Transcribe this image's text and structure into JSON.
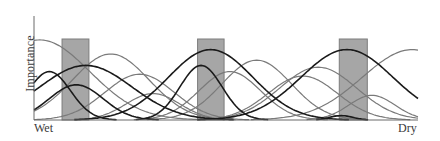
{
  "chart_data": {
    "type": "line",
    "title": "",
    "xlabel": "",
    "ylabel": "Importance",
    "x_axis_ends": {
      "left": "Wet",
      "right": "Dry"
    },
    "grid": false,
    "legend": null,
    "x_range": [
      0,
      100
    ],
    "y_range": [
      0,
      1
    ],
    "shaded_bands": [
      {
        "x0": 7.3,
        "x1": 14.3,
        "color": "#a6a6a6"
      },
      {
        "x0": 42.6,
        "x1": 49.5,
        "color": "#a6a6a6"
      },
      {
        "x0": 79.5,
        "x1": 86.8,
        "color": "#a6a6a6"
      }
    ],
    "series": [
      {
        "name": "curve-1",
        "emphasis": "gray",
        "peak_x": 1.5,
        "peak_y": 0.91,
        "width": 13
      },
      {
        "name": "curve-2",
        "emphasis": "black",
        "peak_x": 13.5,
        "peak_y": 0.62,
        "width": 12
      },
      {
        "name": "curve-3",
        "emphasis": "black",
        "peak_x": 11,
        "peak_y": 0.4,
        "width": 7
      },
      {
        "name": "curve-4",
        "emphasis": "black",
        "peak_x": 4,
        "peak_y": 0.55,
        "width": 5.5
      },
      {
        "name": "curve-5",
        "emphasis": "gray",
        "peak_x": 20,
        "peak_y": 0.75,
        "width": 10
      },
      {
        "name": "curve-6",
        "emphasis": "gray",
        "peak_x": 27.5,
        "peak_y": 0.52,
        "width": 9
      },
      {
        "name": "curve-7",
        "emphasis": "gray",
        "peak_x": 31,
        "peak_y": 0.3,
        "width": 7
      },
      {
        "name": "curve-8",
        "emphasis": "black",
        "peak_x": 46,
        "peak_y": 0.8,
        "width": 11
      },
      {
        "name": "curve-9",
        "emphasis": "black",
        "peak_x": 43.5,
        "peak_y": 0.62,
        "width": 5.5
      },
      {
        "name": "curve-10",
        "emphasis": "gray",
        "peak_x": 51,
        "peak_y": 0.55,
        "width": 8
      },
      {
        "name": "curve-11",
        "emphasis": "gray",
        "peak_x": 58,
        "peak_y": 0.68,
        "width": 9
      },
      {
        "name": "curve-12",
        "emphasis": "gray",
        "peak_x": 70,
        "peak_y": 0.5,
        "width": 9
      },
      {
        "name": "curve-13",
        "emphasis": "gray",
        "peak_x": 74,
        "peak_y": 0.6,
        "width": 10
      },
      {
        "name": "curve-14",
        "emphasis": "black",
        "peak_x": 81.5,
        "peak_y": 0.8,
        "width": 12
      },
      {
        "name": "curve-15",
        "emphasis": "gray",
        "peak_x": 98.5,
        "peak_y": 0.8,
        "width": 13
      },
      {
        "name": "curve-16",
        "emphasis": "gray",
        "peak_x": 88,
        "peak_y": 0.28,
        "width": 6
      },
      {
        "name": "curve-17",
        "emphasis": "black",
        "peak_x": 80,
        "peak_y": 0.05,
        "width": 3
      }
    ]
  },
  "labels": {
    "ylabel": "Importance",
    "x_left": "Wet",
    "x_right": "Dry"
  }
}
